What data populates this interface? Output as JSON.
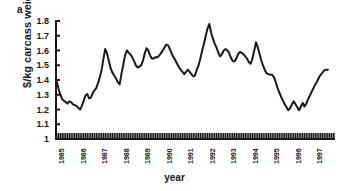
{
  "figure": {
    "panel_label": "a",
    "xlabel": "year",
    "ylabel": "$/kg carcass weight"
  },
  "chart_data": {
    "type": "line",
    "title": "",
    "subtitle": "",
    "xlabel": "year",
    "ylabel": "$/kg carcass weight",
    "xlim": [
      1985.0,
      1998.0
    ],
    "ylim": [
      1.0,
      1.8
    ],
    "yticks": [
      1,
      1.1,
      1.2,
      1.3,
      1.4,
      1.5,
      1.6,
      1.7,
      1.8
    ],
    "ytick_labels": [
      "1",
      "1.1",
      "1.2",
      "1.3",
      "1.4",
      "1.5",
      "1.6",
      "1.7",
      "1.8"
    ],
    "xtick_labels": [
      "1985",
      "1986",
      "1987",
      "1988",
      "1989",
      "1990",
      "1991",
      "1992",
      "1993",
      "1994",
      "1995",
      "1996",
      "1997"
    ],
    "xtick_years": [
      1985,
      1986,
      1987,
      1988,
      1989,
      1990,
      1991,
      1992,
      1993,
      1994,
      1995,
      1996,
      1997
    ],
    "minor_tick_interval": "month",
    "minor_tick_count": 156,
    "grid": false,
    "legend": null,
    "line_color": "#1a1a1a",
    "line_width": 2,
    "marker": "none",
    "series": [
      {
        "name": "$/kg carcass weight",
        "x": [
          1985.0,
          1985.083,
          1985.167,
          1985.25,
          1985.333,
          1985.417,
          1985.5,
          1985.583,
          1985.667,
          1985.75,
          1985.833,
          1985.917,
          1986.0,
          1986.083,
          1986.167,
          1986.25,
          1986.333,
          1986.417,
          1986.5,
          1986.583,
          1986.667,
          1986.75,
          1986.833,
          1986.917,
          1987.0,
          1987.083,
          1987.167,
          1987.25,
          1987.333,
          1987.417,
          1987.5,
          1987.583,
          1987.667,
          1987.75,
          1987.833,
          1987.917,
          1988.0,
          1988.083,
          1988.167,
          1988.25,
          1988.333,
          1988.417,
          1988.5,
          1988.583,
          1988.667,
          1988.75,
          1988.833,
          1988.917,
          1989.0,
          1989.083,
          1989.167,
          1989.25,
          1989.333,
          1989.417,
          1989.5,
          1989.583,
          1989.667,
          1989.75,
          1989.833,
          1989.917,
          1990.0,
          1990.083,
          1990.167,
          1990.25,
          1990.333,
          1990.417,
          1990.5,
          1990.583,
          1990.667,
          1990.75,
          1990.833,
          1990.917,
          1991.0,
          1991.083,
          1991.167,
          1991.25,
          1991.333,
          1991.417,
          1991.5,
          1991.583,
          1991.667,
          1991.75,
          1991.833,
          1991.917,
          1992.0,
          1992.083,
          1992.167,
          1992.25,
          1992.333,
          1992.417,
          1992.5,
          1992.583,
          1992.667,
          1992.75,
          1992.833,
          1992.917,
          1993.0,
          1993.083,
          1993.167,
          1993.25,
          1993.333,
          1993.417,
          1993.5,
          1993.583,
          1993.667,
          1993.75,
          1993.833,
          1993.917,
          1994.0,
          1994.083,
          1994.167,
          1994.25,
          1994.333,
          1994.417,
          1994.5,
          1994.583,
          1994.667,
          1994.75,
          1994.833,
          1994.917,
          1995.0,
          1995.083,
          1995.167,
          1995.25,
          1995.333,
          1995.417,
          1995.5,
          1995.583,
          1995.667,
          1995.75,
          1995.833,
          1995.917,
          1996.0,
          1996.083,
          1996.167,
          1996.25,
          1996.333,
          1996.417,
          1996.5,
          1996.583,
          1996.667,
          1996.75,
          1996.833,
          1996.917,
          1997.0,
          1997.083,
          1997.167,
          1997.25,
          1997.333,
          1997.417,
          1997.5,
          1997.583,
          1997.667
        ],
        "values": [
          1.43,
          1.39,
          1.34,
          1.3,
          1.27,
          1.26,
          1.25,
          1.24,
          1.255,
          1.25,
          1.235,
          1.23,
          1.225,
          1.21,
          1.2,
          1.225,
          1.26,
          1.295,
          1.305,
          1.275,
          1.28,
          1.31,
          1.33,
          1.345,
          1.38,
          1.42,
          1.47,
          1.545,
          1.61,
          1.58,
          1.53,
          1.48,
          1.45,
          1.43,
          1.41,
          1.385,
          1.37,
          1.44,
          1.5,
          1.565,
          1.6,
          1.585,
          1.575,
          1.555,
          1.53,
          1.5,
          1.485,
          1.49,
          1.5,
          1.53,
          1.58,
          1.615,
          1.6,
          1.565,
          1.545,
          1.545,
          1.555,
          1.555,
          1.565,
          1.58,
          1.6,
          1.62,
          1.64,
          1.635,
          1.61,
          1.58,
          1.555,
          1.535,
          1.51,
          1.49,
          1.47,
          1.455,
          1.44,
          1.455,
          1.47,
          1.455,
          1.44,
          1.425,
          1.43,
          1.47,
          1.5,
          1.545,
          1.6,
          1.645,
          1.7,
          1.75,
          1.78,
          1.72,
          1.68,
          1.645,
          1.62,
          1.585,
          1.56,
          1.575,
          1.6,
          1.61,
          1.6,
          1.585,
          1.55,
          1.53,
          1.525,
          1.545,
          1.575,
          1.59,
          1.585,
          1.575,
          1.56,
          1.545,
          1.52,
          1.51,
          1.545,
          1.6,
          1.655,
          1.62,
          1.575,
          1.53,
          1.495,
          1.465,
          1.445,
          1.44,
          1.435,
          1.435,
          1.42,
          1.385,
          1.345,
          1.315,
          1.285,
          1.26,
          1.235,
          1.215,
          1.195,
          1.21,
          1.235,
          1.255,
          1.235,
          1.215,
          1.195,
          1.22,
          1.245,
          1.22,
          1.24,
          1.27,
          1.295,
          1.32,
          1.345,
          1.37,
          1.39,
          1.415,
          1.435,
          1.45,
          1.465,
          1.47,
          1.47
        ]
      }
    ]
  }
}
